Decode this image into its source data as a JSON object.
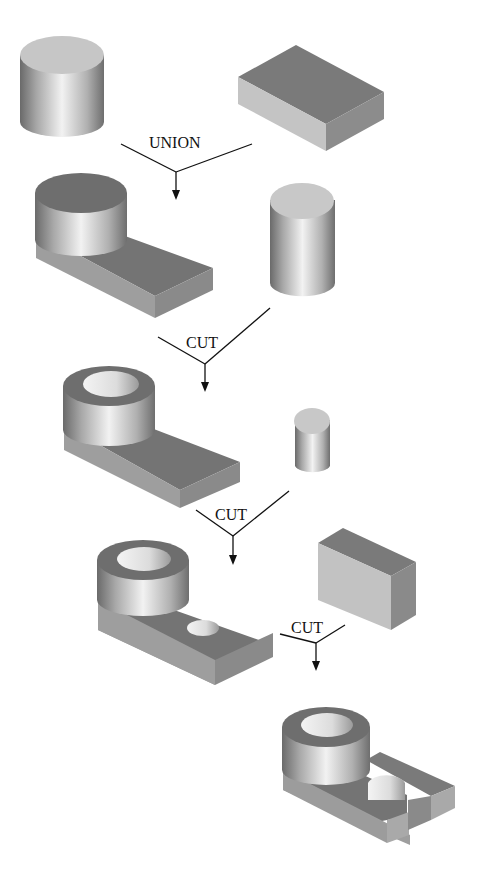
{
  "diagram": {
    "type": "CSG tree (constructive solid geometry)",
    "operations": [
      {
        "id": "op1",
        "label": "UNION",
        "inputs": [
          "cylinder-large",
          "box-slab"
        ],
        "result": "step1-boss-on-slab"
      },
      {
        "id": "op2",
        "label": "CUT",
        "inputs": [
          "step1-boss-on-slab",
          "cylinder-medium"
        ],
        "result": "step2-hollow-boss"
      },
      {
        "id": "op3",
        "label": "CUT",
        "inputs": [
          "step2-hollow-boss",
          "cylinder-small"
        ],
        "result": "step3-slab-hole"
      },
      {
        "id": "op4",
        "label": "CUT",
        "inputs": [
          "step3-slab-hole",
          "box-block"
        ],
        "result": "step4-slotted-part"
      }
    ]
  },
  "colors": {
    "background": "#ffffff",
    "top_dark": "#777777",
    "top_light": "#c8c8c8",
    "side_light": "#bdbdbd",
    "side_dark": "#8a8a8a",
    "line": "#111111"
  }
}
